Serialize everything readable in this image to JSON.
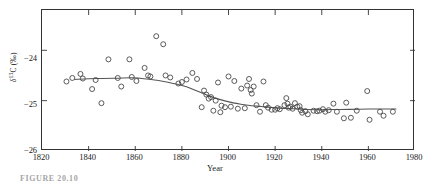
{
  "figure": {
    "caption": "FIGURE 20.10"
  },
  "chart_data": {
    "type": "scatter",
    "title": "",
    "xlabel": "Year",
    "ylabel": "δ 13C (‰)",
    "ylabel_parts": {
      "symbol": "δ",
      "sup": "13",
      "element": "C",
      "units": "(‰)"
    },
    "xlim": [
      1820,
      1980
    ],
    "ylim": [
      -26,
      -23.2
    ],
    "xticks": [
      1820,
      1840,
      1860,
      1880,
      1900,
      1920,
      1940,
      1960,
      1980
    ],
    "xticklabels": [
      "1820",
      "1840",
      "1860",
      "1880",
      "1900",
      "1920",
      "1940",
      "1960",
      "1980"
    ],
    "yticks": [
      -24,
      -25,
      -26
    ],
    "yticklabels": [
      "−24",
      "−25",
      "−26"
    ],
    "grid": false,
    "legend": false,
    "marker": "open-circle",
    "marker_color": "#4a4a4a",
    "line_color": "#555555",
    "points": [
      [
        1830.5,
        -24.62
      ],
      [
        1833.0,
        -24.55
      ],
      [
        1836.5,
        -24.47
      ],
      [
        1837.5,
        -24.56
      ],
      [
        1841.5,
        -24.77
      ],
      [
        1843.0,
        -24.59
      ],
      [
        1845.5,
        -25.05
      ],
      [
        1848.5,
        -24.18
      ],
      [
        1852.5,
        -24.55
      ],
      [
        1854.0,
        -24.72
      ],
      [
        1857.5,
        -24.18
      ],
      [
        1858.5,
        -24.53
      ],
      [
        1860.5,
        -24.61
      ],
      [
        1864.0,
        -24.35
      ],
      [
        1865.5,
        -24.5
      ],
      [
        1866.5,
        -24.52
      ],
      [
        1869.0,
        -23.72
      ],
      [
        1872.0,
        -23.88
      ],
      [
        1873.0,
        -24.5
      ],
      [
        1875.0,
        -24.54
      ],
      [
        1878.5,
        -24.66
      ],
      [
        1880.0,
        -24.63
      ],
      [
        1882.0,
        -24.58
      ],
      [
        1884.5,
        -24.45
      ],
      [
        1886.5,
        -24.57
      ],
      [
        1888.5,
        -25.13
      ],
      [
        1889.5,
        -24.8
      ],
      [
        1890.5,
        -24.88
      ],
      [
        1891.5,
        -24.96
      ],
      [
        1892.5,
        -24.93
      ],
      [
        1893.5,
        -25.2
      ],
      [
        1894.5,
        -25.0
      ],
      [
        1895.5,
        -24.64
      ],
      [
        1896.5,
        -25.23
      ],
      [
        1897.0,
        -25.1
      ],
      [
        1898.5,
        -25.13
      ],
      [
        1900.0,
        -24.52
      ],
      [
        1901.0,
        -25.12
      ],
      [
        1902.5,
        -24.61
      ],
      [
        1904.0,
        -25.16
      ],
      [
        1905.5,
        -24.76
      ],
      [
        1907.0,
        -25.15
      ],
      [
        1908.0,
        -24.7
      ],
      [
        1908.8,
        -24.57
      ],
      [
        1909.5,
        -24.79
      ],
      [
        1910.0,
        -24.86
      ],
      [
        1910.8,
        -24.72
      ],
      [
        1912.0,
        -25.09
      ],
      [
        1913.5,
        -25.22
      ],
      [
        1915.0,
        -24.62
      ],
      [
        1916.0,
        -25.09
      ],
      [
        1917.0,
        -25.14
      ],
      [
        1918.5,
        -25.18
      ],
      [
        1920.0,
        -25.18
      ],
      [
        1921.0,
        -25.15
      ],
      [
        1922.0,
        -25.17
      ],
      [
        1924.0,
        -25.09
      ],
      [
        1924.8,
        -24.95
      ],
      [
        1925.3,
        -25.06
      ],
      [
        1925.8,
        -25.14
      ],
      [
        1926.5,
        -25.12
      ],
      [
        1927.5,
        -25.16
      ],
      [
        1928.5,
        -25.05
      ],
      [
        1929.5,
        -25.12
      ],
      [
        1930.5,
        -25.11
      ],
      [
        1931.0,
        -25.19
      ],
      [
        1931.6,
        -25.24
      ],
      [
        1933.0,
        -25.21
      ],
      [
        1934.0,
        -25.27
      ],
      [
        1936.5,
        -25.2
      ],
      [
        1938.0,
        -25.21
      ],
      [
        1939.0,
        -25.2
      ],
      [
        1940.5,
        -25.17
      ],
      [
        1941.5,
        -25.22
      ],
      [
        1943.0,
        -25.19
      ],
      [
        1945.0,
        -25.06
      ],
      [
        1946.5,
        -25.22
      ],
      [
        1949.5,
        -25.35
      ],
      [
        1950.5,
        -25.04
      ],
      [
        1952.5,
        -25.34
      ],
      [
        1955.0,
        -25.2
      ],
      [
        1959.5,
        -24.81
      ],
      [
        1960.5,
        -25.38
      ],
      [
        1965.0,
        -25.22
      ],
      [
        1966.5,
        -25.3
      ],
      [
        1970.5,
        -25.22
      ]
    ],
    "trend_line": [
      [
        1834.0,
        -24.58
      ],
      [
        1840.0,
        -24.565
      ],
      [
        1846.0,
        -24.56
      ],
      [
        1852.0,
        -24.555
      ],
      [
        1858.0,
        -24.545
      ],
      [
        1862.0,
        -24.555
      ],
      [
        1866.0,
        -24.575
      ],
      [
        1870.0,
        -24.6
      ],
      [
        1874.0,
        -24.635
      ],
      [
        1878.0,
        -24.675
      ],
      [
        1882.0,
        -24.725
      ],
      [
        1886.0,
        -24.8
      ],
      [
        1890.0,
        -24.875
      ],
      [
        1894.0,
        -24.945
      ],
      [
        1898.0,
        -25.0
      ],
      [
        1902.0,
        -25.045
      ],
      [
        1906.0,
        -25.075
      ],
      [
        1910.0,
        -25.1
      ],
      [
        1914.0,
        -25.115
      ],
      [
        1918.0,
        -25.135
      ],
      [
        1922.0,
        -25.15
      ],
      [
        1926.0,
        -25.155
      ],
      [
        1930.0,
        -25.165
      ],
      [
        1934.0,
        -25.175
      ],
      [
        1940.0,
        -25.18
      ],
      [
        1948.0,
        -25.175
      ],
      [
        1956.0,
        -25.17
      ],
      [
        1964.0,
        -25.165
      ],
      [
        1972.0,
        -25.165
      ]
    ]
  }
}
